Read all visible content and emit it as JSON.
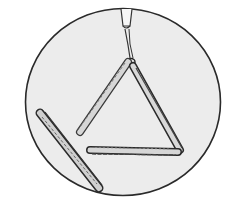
{
  "illustration": {
    "subject": "Triangle instrument with beater",
    "elements": [
      "circle-frame",
      "hanging-string",
      "triangle",
      "beater"
    ],
    "colors": {
      "background": "#ffffff",
      "circle_fill": "#ececec",
      "outline": "#2a2a2a",
      "metal": "#d6d6d6",
      "shadow": "#555555"
    }
  }
}
